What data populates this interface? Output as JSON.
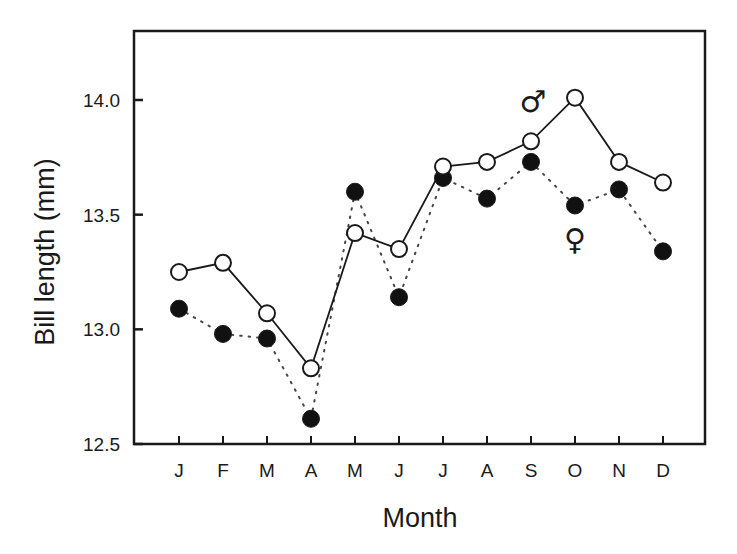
{
  "chart_data": {
    "type": "line",
    "title": "",
    "xlabel": "Month",
    "ylabel": "Bill length (mm)",
    "categories": [
      "J",
      "F",
      "M",
      "A",
      "M",
      "J",
      "J",
      "A",
      "S",
      "O",
      "N",
      "D"
    ],
    "ylim": [
      12.5,
      14.3
    ],
    "yticks": [
      12.5,
      13.0,
      13.5,
      14.0
    ],
    "ytick_labels": [
      "12.5",
      "13.0",
      "13.5",
      "14.0"
    ],
    "grid": false,
    "legend": "inline symbols (♂ near male line, ♀ near female line)",
    "series": [
      {
        "name": "Male",
        "symbol": "♂",
        "marker": "open-circle",
        "line": "solid",
        "values": [
          13.25,
          13.29,
          13.07,
          12.83,
          13.42,
          13.35,
          13.71,
          13.73,
          13.82,
          14.01,
          13.73,
          13.64
        ]
      },
      {
        "name": "Female",
        "symbol": "♀",
        "marker": "filled-circle",
        "line": "dotted",
        "values": [
          13.09,
          12.98,
          12.96,
          12.61,
          13.6,
          13.14,
          13.66,
          13.57,
          13.73,
          13.54,
          13.61,
          13.34
        ]
      }
    ],
    "annotations": [
      {
        "text": "♂",
        "near": "O",
        "value": 14.13
      },
      {
        "text": "♀",
        "near": "O",
        "value": 13.43
      }
    ]
  },
  "colors": {
    "axis": "#1a1a1a",
    "male_fill": "#ffffff",
    "female_fill": "#111111",
    "background": "#ffffff"
  }
}
